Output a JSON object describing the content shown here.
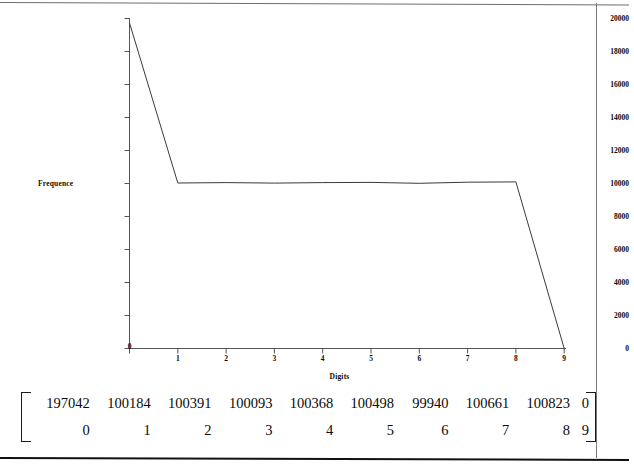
{
  "chart_data": {
    "type": "line",
    "title": "",
    "xlabel": "Digits",
    "ylabel": "Frequence",
    "categories": [
      0,
      1,
      2,
      3,
      4,
      5,
      6,
      7,
      8,
      9
    ],
    "values": [
      197042,
      100184,
      100391,
      100093,
      100368,
      100498,
      99940,
      100661,
      100823,
      0
    ],
    "plotted_values": [
      19704,
      10018,
      10039,
      10009,
      10037,
      10050,
      9994,
      10066,
      10082,
      0
    ],
    "xlim": [
      0,
      9
    ],
    "ylim": [
      0,
      20000
    ],
    "ytick_labels": [
      "0",
      "2000",
      "4000",
      "6000",
      "8000",
      "10000",
      "12000",
      "14000",
      "16000",
      "18000",
      "20000"
    ],
    "ytick_values": [
      0,
      2000,
      4000,
      6000,
      8000,
      10000,
      12000,
      14000,
      16000,
      18000,
      20000
    ],
    "xtick_labels": [
      "0",
      "1",
      "2",
      "3",
      "4",
      "5",
      "6",
      "7",
      "8",
      "9"
    ],
    "grid": false,
    "legend": "none",
    "line_color": "#3a3a3a",
    "axis_color": "#555555"
  },
  "matrix": {
    "rows": [
      {
        "name": "counts",
        "cells": [
          "197042",
          "100184",
          "100391",
          "100093",
          "100368",
          "100498",
          "99940",
          "100661",
          "100823",
          "0"
        ]
      },
      {
        "name": "digits",
        "cells": [
          "0",
          "1",
          "2",
          "3",
          "4",
          "5",
          "6",
          "7",
          "8",
          "9"
        ]
      }
    ],
    "bracket_left": "[",
    "bracket_right": "]"
  }
}
